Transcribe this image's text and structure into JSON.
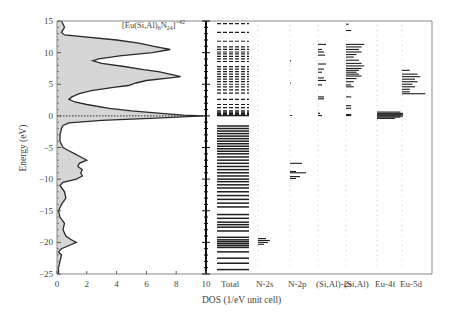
{
  "chart_data": {
    "type": "area",
    "title": "",
    "annotation": "[Eu(Si,Al)6N24]-42",
    "xlabel": "DOS (1/eV unit cell)",
    "ylabel": "Energy (eV)",
    "ylim": [
      -25,
      15
    ],
    "xlim": [
      0,
      10
    ],
    "yticks": [
      15,
      10,
      5,
      0,
      -5,
      -10,
      -15,
      -20,
      -25
    ],
    "xticks": [
      0,
      2,
      4,
      6,
      8,
      10
    ],
    "grid": false,
    "fermi_level_line": 0,
    "total_dos_curve": {
      "name": "Total DOS",
      "energy": [
        15,
        14,
        13.2,
        12.8,
        12,
        11.5,
        11,
        10.5,
        10,
        9.5,
        9,
        8.7,
        8.3,
        7.8,
        7.3,
        7,
        6.5,
        6.2,
        6,
        5.6,
        5.2,
        4.8,
        4.5,
        4,
        3.5,
        3,
        2.6,
        2.2,
        1.8,
        1.2,
        0.8,
        0.4,
        0.1,
        0,
        -0.3,
        -0.7,
        -1.1,
        -1.5,
        -2,
        -3,
        -4,
        -5,
        -5.5,
        -6,
        -6.5,
        -7,
        -7.5,
        -8,
        -8.5,
        -9,
        -9.5,
        -10,
        -10.5,
        -11,
        -12,
        -13,
        -14,
        -15,
        -16,
        -17,
        -18,
        -19,
        -19.5,
        -20,
        -20.5,
        -21,
        -21.5,
        -22,
        -23,
        -24,
        -25
      ],
      "dos": [
        0.3,
        0.5,
        0.3,
        0.5,
        4.0,
        5.5,
        6.5,
        7.6,
        6.4,
        4.2,
        2.8,
        2.4,
        3.0,
        4.5,
        5.8,
        6.8,
        7.8,
        8.3,
        7.6,
        6.0,
        5.3,
        4.8,
        3.8,
        2.3,
        1.5,
        1.0,
        0.8,
        1.2,
        2.0,
        3.5,
        5.0,
        7.0,
        8.5,
        9.8,
        7.0,
        3.0,
        0.8,
        0.4,
        0.3,
        0.2,
        0.2,
        0.4,
        0.8,
        1.2,
        1.6,
        2.0,
        1.5,
        1.4,
        1.7,
        1.6,
        1.7,
        1.3,
        0.4,
        0.2,
        0.5,
        0.6,
        0.3,
        0.1,
        0.2,
        0.5,
        0.4,
        0.6,
        0.9,
        1.3,
        0.8,
        0.3,
        0.1,
        0.3,
        0.2,
        0.1,
        0.1
      ]
    },
    "projected_dos_columns": [
      {
        "name": "Total",
        "levels": [
          14.6,
          13.2,
          11.8,
          10.9,
          10.5,
          10.1,
          9.8,
          9.4,
          9.0,
          8.6,
          7.8,
          7.4,
          7.0,
          6.6,
          6.2,
          5.8,
          5.4,
          5.0,
          4.6,
          4.1,
          3.6,
          2.6,
          1.8,
          1.3,
          0.8,
          0.6,
          0.4,
          0.2,
          0.05,
          -1.6,
          -2.0,
          -2.4,
          -2.8,
          -3.2,
          -3.6,
          -4.0,
          -4.4,
          -4.8,
          -5.2,
          -5.6,
          -6.0,
          -6.5,
          -7.0,
          -7.5,
          -8.0,
          -8.5,
          -9.0,
          -9.5,
          -10.0,
          -10.4,
          -10.9,
          -11.4,
          -12.0,
          -12.6,
          -13.2,
          -13.8,
          -14.4,
          -15.6,
          -16.2,
          -16.8,
          -17.2,
          -17.6,
          -18.2,
          -19.2,
          -19.6,
          -19.9,
          -20.2,
          -20.5,
          -20.8,
          -21.5,
          -22.5,
          -23.3,
          -24.3
        ]
      },
      {
        "name": "N-2s",
        "levels": [
          -19.4,
          -19.7,
          -20.0,
          -20.3
        ],
        "magnitudes": [
          0.4,
          0.6,
          0.5,
          0.3
        ]
      },
      {
        "name": "N-2p",
        "levels": [
          8.7,
          5.2,
          0.05,
          -7.5,
          -8.8,
          -9.0,
          -9.6,
          -9.9
        ],
        "magnitudes": [
          0.05,
          0.05,
          0.1,
          0.6,
          0.3,
          0.8,
          0.5,
          0.3
        ]
      },
      {
        "name": "(Si,Al)-2s",
        "levels": [
          11.3,
          10.5,
          10.1,
          9.6,
          8.2,
          7.4,
          6.9,
          6.0,
          5.6,
          4.9,
          3.0,
          2.7,
          0.4,
          0.05
        ],
        "magnitudes": [
          0.4,
          0.2,
          0.3,
          0.35,
          0.4,
          0.3,
          0.2,
          0.3,
          0.4,
          0.2,
          0.3,
          0.3,
          0.1,
          0.2
        ]
      },
      {
        "name": "(Si,Al)",
        "levels": [
          14.5,
          13.5,
          11.3,
          10.9,
          10.5,
          10.1,
          9.7,
          9.3,
          8.8,
          8.3,
          7.9,
          7.5,
          7.2,
          6.9,
          6.6,
          6.3,
          5.9,
          5.4,
          4.9,
          4.6,
          3.0,
          1.6,
          1.2,
          0.2,
          0.05
        ],
        "magnitudes": [
          0.1,
          0.2,
          0.7,
          0.6,
          0.5,
          0.6,
          0.4,
          0.3,
          0.5,
          0.6,
          0.7,
          0.6,
          0.5,
          0.4,
          0.5,
          0.6,
          0.4,
          0.3,
          0.2,
          0.3,
          0.2,
          0.2,
          0.2,
          0.2,
          0.2
        ]
      },
      {
        "name": "Eu-4f",
        "levels": [
          0.6,
          0.4,
          0.25,
          0.1,
          -0.05,
          -0.2,
          -0.4
        ],
        "magnitudes": [
          0.9,
          1.0,
          1.0,
          1.0,
          1.0,
          0.9,
          0.7
        ]
      },
      {
        "name": "Eu-5d",
        "levels": [
          7.2,
          6.6,
          6.2,
          5.8,
          5.4,
          5.0,
          4.6,
          4.2,
          3.8,
          3.5
        ],
        "magnitudes": [
          0.3,
          0.6,
          0.7,
          0.5,
          0.6,
          0.4,
          0.5,
          0.3,
          0.3,
          0.9
        ]
      }
    ]
  },
  "labels": {
    "annotation_main": "[Eu(Si,Al)",
    "annotation_sub1": "6",
    "annotation_mid": "N",
    "annotation_sub2": "24",
    "annotation_end": "]",
    "annotation_sup": "−42",
    "xlabel": "DOS (1/eV unit cell)",
    "ylabel": "Energy (eV)",
    "columns": [
      "Total",
      "N-2s",
      "N-2p",
      "(Si,Al)-2s",
      "(Si,Al)",
      "Eu-4f",
      "Eu-5d"
    ],
    "yticks": [
      "15",
      "10",
      "5",
      "0",
      "−5",
      "−10",
      "−15",
      "−20",
      "−25"
    ],
    "xticks": [
      "0",
      "2",
      "4",
      "6",
      "8",
      "10"
    ]
  },
  "colors": {
    "fill": "#d6d6d6",
    "line": "#2a2a2a",
    "frame": "#888888",
    "bars": "#1e1e1e"
  }
}
